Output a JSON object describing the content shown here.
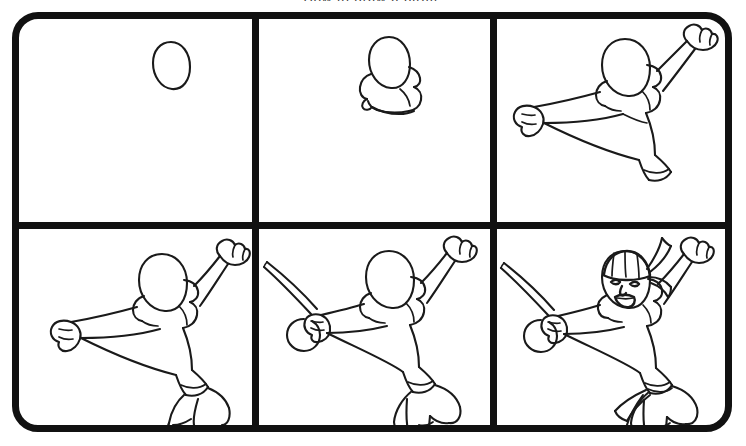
{
  "image": {
    "kind": "step-by-step-drawing-tutorial",
    "subject": "pirate-swashbuckler",
    "clipped_title_fragment": "How to draw a pirate",
    "background_color": "#ffffff",
    "ink_color": "#1a1a1a",
    "frame_color": "#111111",
    "width": 746,
    "height": 446,
    "grid": {
      "columns": 3,
      "rows": 2,
      "total_steps": 6
    }
  },
  "panels": [
    {
      "step_number": 1,
      "position": "row1-col1",
      "label": "Step 1",
      "description": "An empty oval for the head, placed in the upper area of the panel.",
      "elements_added": [
        "head-oval"
      ]
    },
    {
      "step_number": 2,
      "position": "row1-col2",
      "label": "Step 2",
      "description": "Collar and shoulder yoke sketched beneath the head oval.",
      "elements_added": [
        "head-oval",
        "collar",
        "shoulder-yoke"
      ]
    },
    {
      "step_number": 3,
      "position": "row1-col3",
      "label": "Step 3",
      "description": "Torso with both arms: right arm raised overhead with a clenched fist, left arm extended outward with a clenched fist; cuff at the hem.",
      "elements_added": [
        "torso",
        "raised-arm",
        "extended-arm",
        "fist-upper",
        "fist-left",
        "shirt-cuff"
      ]
    },
    {
      "step_number": 4,
      "position": "row2-col1",
      "label": "Step 4",
      "description": "Billowing pirate pants added below the waistband, with legs bent in a mid-air leap.",
      "elements_added": [
        "waistband",
        "baggy-pants",
        "legs"
      ]
    },
    {
      "step_number": 5,
      "position": "row2-col2",
      "label": "Step 5",
      "description": "Curved cutlass with basket hilt placed in the extended hand; tall cuffed boots added to the feet.",
      "elements_added": [
        "cutlass-blade",
        "cutlass-hilt",
        "boots"
      ]
    },
    {
      "step_number": 6,
      "position": "row2-col3",
      "label": "Step 6",
      "description": "Finished pirate: striped head bandana with trailing knot, face with eyes, nose and open shouting mouth, and a waist sash with hanging tails.",
      "elements_added": [
        "bandana",
        "bandana-tails",
        "eyes",
        "nose",
        "open-mouth",
        "waist-sash",
        "sash-tails"
      ]
    }
  ]
}
